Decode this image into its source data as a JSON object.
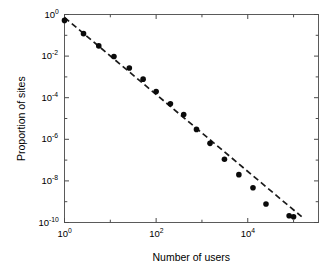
{
  "chart_data": {
    "type": "scatter",
    "title": "",
    "xlabel": "Number of users",
    "ylabel": "Proportion of sites",
    "xscale": "log",
    "yscale": "log",
    "xlim": [
      1,
      350000
    ],
    "ylim": [
      1e-10,
      1
    ],
    "grid": false,
    "legend": null,
    "xtick_labels": [
      "10^0",
      "10^2",
      "10^4"
    ],
    "xtick_mantissas": [
      "10",
      "10",
      "10"
    ],
    "xtick_exponents": [
      "0",
      "2",
      "4"
    ],
    "xtick_values": [
      1,
      100,
      10000
    ],
    "xtick_minor_values": [
      10,
      1000,
      100000
    ],
    "ytick_labels": [
      "10^0",
      "10^-2",
      "10^-4",
      "10^-6",
      "10^-8",
      "10^-10"
    ],
    "ytick_mantissas": [
      "10",
      "10",
      "10",
      "10",
      "10",
      "10"
    ],
    "ytick_exponents": [
      "0",
      "-2",
      "-4",
      "-6",
      "-8",
      "-10"
    ],
    "ytick_values": [
      1,
      0.01,
      0.0001,
      1e-06,
      1e-08,
      1e-10
    ],
    "ytick_minor_values": [
      0.1,
      0.001,
      1e-05,
      1e-07,
      1e-09
    ],
    "marker": {
      "shape": "circle",
      "color": "#0a0a0a",
      "size_px": 5.6,
      "filled": true
    },
    "trendline": {
      "style": "dashed",
      "color": "#1a1a1a",
      "width_px": 1.7,
      "dash_pattern": "6,3.5",
      "x_start": 1.0,
      "y_start": 0.72,
      "x_end": 150000,
      "y_end": 1.9e-10,
      "slope": -1.79,
      "description": "power-law fit line"
    },
    "points": [
      {
        "x": 1.0,
        "y": 0.52
      },
      {
        "x": 2.6,
        "y": 0.12
      },
      {
        "x": 5.6,
        "y": 0.031
      },
      {
        "x": 12.0,
        "y": 0.0095
      },
      {
        "x": 26.0,
        "y": 0.0027
      },
      {
        "x": 52.0,
        "y": 0.00078
      },
      {
        "x": 100.0,
        "y": 0.0002
      },
      {
        "x": 205.0,
        "y": 5.1e-05
      },
      {
        "x": 400.0,
        "y": 1.55e-05
      },
      {
        "x": 760.0,
        "y": 3e-06
      },
      {
        "x": 1500.0,
        "y": 6.4e-07
      },
      {
        "x": 3100.0,
        "y": 1.1e-07
      },
      {
        "x": 6400.0,
        "y": 2e-08
      },
      {
        "x": 13000.0,
        "y": 4.7e-09
      },
      {
        "x": 25000.0,
        "y": 7.8e-10
      },
      {
        "x": 80000.0,
        "y": 2.1e-10
      },
      {
        "x": 100000.0,
        "y": 1.9e-10
      }
    ]
  },
  "axes": {
    "x_title": "Number of users",
    "y_title": "Proportion of sites"
  }
}
